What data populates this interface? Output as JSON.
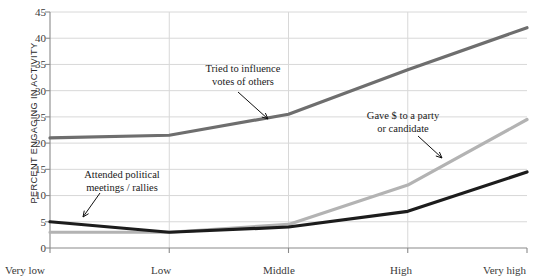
{
  "chart_data": {
    "type": "line",
    "title": "",
    "xlabel": "",
    "ylabel": "PERCENT ENGAGING IN ACTIVITY",
    "categories": [
      "Very low",
      "Low",
      "Middle",
      "High",
      "Very high"
    ],
    "ylim": [
      0,
      45
    ],
    "yticks": [
      0,
      5,
      10,
      15,
      20,
      25,
      30,
      35,
      40,
      45
    ],
    "grid": true,
    "legend": "annotations",
    "series": [
      {
        "name": "Tried to influence votes of others",
        "color": "#6e6e6e",
        "values": [
          21,
          21.5,
          25.5,
          34,
          42
        ]
      },
      {
        "name": "Gave $ to a party or candidate",
        "color": "#b3b3b3",
        "values": [
          3,
          3,
          4.5,
          12,
          24.5
        ]
      },
      {
        "name": "Attended political meetings/rallies",
        "color": "#1c1c1c",
        "values": [
          5,
          3,
          4,
          7,
          14.5
        ]
      }
    ],
    "annotations": [
      {
        "id": "influence",
        "text": "Tried to influence\nvotes of others",
        "target_series": "Tried to influence votes of others"
      },
      {
        "id": "money",
        "text": "Gave $ to a party\nor candidate",
        "target_series": "Gave $ to a party or candidate"
      },
      {
        "id": "meetings",
        "text": "Attended political\nmeetings / rallies",
        "target_series": "Attended political meetings/rallies"
      }
    ]
  },
  "axis": {
    "y_title": "PERCENT ENGAGING IN ACTIVITY",
    "y_labels": [
      "45",
      "40",
      "35",
      "30",
      "25",
      "20",
      "15",
      "10",
      "5",
      "0"
    ],
    "x_labels": [
      "Very low",
      "Low",
      "Middle",
      "High",
      "Very high"
    ]
  },
  "annotations": {
    "influence": "Tried to influence\nvotes of others",
    "money": "Gave $ to a party\nor candidate",
    "meetings": "Attended political\nmeetings / rallies"
  },
  "colors": {
    "series_influence": "#6e6e6e",
    "series_money": "#b3b3b3",
    "series_meetings": "#1c1c1c",
    "axis": "#8a8a8a",
    "grid": "#d8d8d8"
  }
}
